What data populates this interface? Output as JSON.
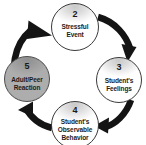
{
  "diagram": {
    "type": "cycle",
    "direction": "clockwise",
    "background_color": "#ffffff",
    "arrow_color": "#141414",
    "node_outline_color": "#3a3a3a",
    "shaded_node_fill": "#a9a9a9",
    "white_node_fill": "#ffffff",
    "nodes": [
      {
        "id": "node-2",
        "number": "2",
        "label": "Stressful\nEvent",
        "label_lines": [
          "Stressful",
          "Event"
        ],
        "position": "top",
        "shaded": false
      },
      {
        "id": "node-3",
        "number": "3",
        "label": "Student's\nFeelings",
        "label_lines": [
          "Student's",
          "Feelings"
        ],
        "position": "right",
        "shaded": false
      },
      {
        "id": "node-4",
        "number": "4",
        "label": "Student's\nObservable\nBehavior",
        "label_lines": [
          "Student's",
          "Observable",
          "Behavior"
        ],
        "position": "bottom",
        "shaded": false
      },
      {
        "id": "node-5",
        "number": "5",
        "label": "Adult/Peer\nReaction",
        "label_lines": [
          "Adult/Peer",
          "Reaction"
        ],
        "position": "left",
        "shaded": true
      }
    ],
    "arrows": [
      {
        "id": "arrow-5-to-2",
        "from": "node-5",
        "to": "node-2"
      },
      {
        "id": "arrow-2-to-3",
        "from": "node-2",
        "to": "node-3"
      },
      {
        "id": "arrow-3-to-4",
        "from": "node-3",
        "to": "node-4"
      },
      {
        "id": "arrow-4-to-5",
        "from": "node-4",
        "to": "node-5"
      }
    ]
  }
}
